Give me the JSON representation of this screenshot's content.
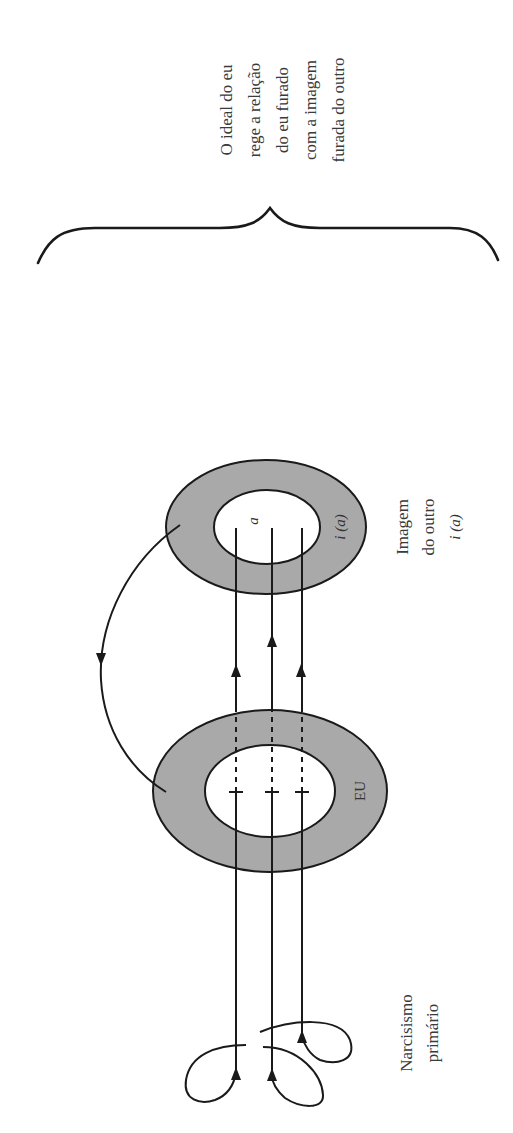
{
  "diagram": {
    "orientation": "rotated-90-ccw",
    "colors": {
      "ring_fill": "#a9a9a9",
      "stroke": "#1a1a1a",
      "text": "#3a3a3a",
      "background": "#ffffff"
    },
    "annotation": {
      "lines": [
        "O ideal do eu",
        "rege a relação",
        "do eu furado",
        "com a imagem",
        "furada do outro"
      ]
    },
    "nodes": {
      "other_image": {
        "ring_label": "i (a)",
        "hole_label": "a",
        "caption": [
          "Imagem",
          "do outro",
          "i (a)"
        ]
      },
      "ego": {
        "ring_label": "EU"
      },
      "primary_narcissism": {
        "caption": [
          "Narcisismo",
          "primário"
        ]
      }
    },
    "edges": [
      {
        "from": "primary_narcissism",
        "to": "ego",
        "count": 3,
        "style": "solid",
        "note": "three looped lines rising"
      },
      {
        "from": "ego",
        "to": "other_image",
        "count": 3,
        "style": "dashed-then-solid",
        "arrow": "up"
      },
      {
        "from": "other_image",
        "to": "ego",
        "count": 1,
        "style": "curved",
        "arrow": "return"
      }
    ]
  }
}
